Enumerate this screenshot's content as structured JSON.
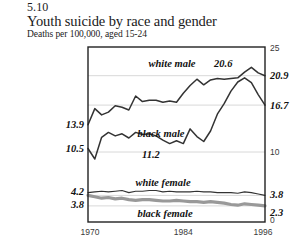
{
  "figure_number": "5.10",
  "title": "Youth suicide by race and gender",
  "subtitle": "Deaths per 100,000, aged 15-24",
  "axis": {
    "x_ticks": [
      "1970",
      "1984",
      "1996"
    ],
    "left_labels": [
      "13.9",
      "10.5",
      "4.2",
      "3.8"
    ],
    "right_labels": [
      "25",
      "20.9",
      "16.7",
      "10",
      "3.8",
      "2.3",
      "0"
    ]
  },
  "annotations": [
    {
      "text": "20.6"
    },
    {
      "text": "11.2"
    }
  ],
  "series_labels": [
    "white male",
    "black male",
    "white female",
    "black female"
  ],
  "colors": {
    "dark_line": "#333333",
    "gray_line": "#999999",
    "frame": "#222222",
    "gridline": "#d8d8d8",
    "background": "#ffffff"
  },
  "chart_data": {
    "type": "line",
    "title": "Youth suicide by race and gender",
    "subtitle": "Deaths per 100,000, aged 15-24",
    "xlabel": "",
    "ylabel": "Deaths per 100,000, aged 15-24",
    "xlim": [
      1970,
      1996
    ],
    "ylim": [
      0,
      25
    ],
    "grid": true,
    "legend": "inline-labels",
    "x": [
      1970,
      1971,
      1972,
      1973,
      1974,
      1975,
      1976,
      1977,
      1978,
      1979,
      1980,
      1981,
      1982,
      1983,
      1984,
      1985,
      1986,
      1987,
      1988,
      1989,
      1990,
      1991,
      1992,
      1993,
      1994,
      1995,
      1996
    ],
    "series": [
      {
        "name": "white male",
        "color": "#333333",
        "style": "thin-dark",
        "start_value": 13.9,
        "end_value": 20.9,
        "values": [
          13.9,
          16.2,
          15.3,
          15.7,
          16.6,
          16.4,
          16.0,
          18.0,
          17.2,
          17.4,
          17.4,
          17.1,
          17.3,
          17.1,
          18.4,
          19.5,
          20.4,
          19.6,
          20.3,
          20.5,
          20.4,
          20.5,
          20.6,
          21.4,
          22.1,
          21.3,
          20.9
        ]
      },
      {
        "name": "black male",
        "color": "#333333",
        "style": "thin-dark",
        "start_value": 10.5,
        "end_value": 16.7,
        "annotation": "11.2",
        "values": [
          10.5,
          9.0,
          12.1,
          12.8,
          12.3,
          12.6,
          12.0,
          12.8,
          12.5,
          12.6,
          12.3,
          11.7,
          11.2,
          11.6,
          11.2,
          13.3,
          12.2,
          11.5,
          13.0,
          15.4,
          16.9,
          18.7,
          20.0,
          20.6,
          19.9,
          18.2,
          16.7
        ]
      },
      {
        "name": "white female",
        "color": "#333333",
        "style": "thin-dark",
        "start_value": 4.2,
        "end_value": 3.8,
        "values": [
          4.2,
          4.3,
          4.4,
          4.3,
          4.4,
          4.5,
          4.2,
          4.4,
          4.4,
          4.5,
          4.5,
          4.3,
          4.4,
          4.3,
          4.3,
          4.3,
          4.4,
          4.3,
          4.3,
          4.2,
          4.2,
          4.2,
          4.1,
          4.3,
          4.2,
          4.0,
          3.8
        ]
      },
      {
        "name": "black female",
        "color": "#999999",
        "style": "thick-gray",
        "start_value": 3.8,
        "end_value": 2.3,
        "values": [
          3.8,
          3.6,
          3.4,
          3.5,
          3.3,
          3.4,
          3.2,
          3.1,
          3.2,
          3.2,
          3.1,
          3.0,
          3.0,
          3.1,
          3.0,
          2.9,
          2.9,
          2.8,
          2.9,
          2.8,
          2.7,
          2.5,
          2.4,
          2.6,
          2.5,
          2.4,
          2.3
        ]
      }
    ]
  }
}
